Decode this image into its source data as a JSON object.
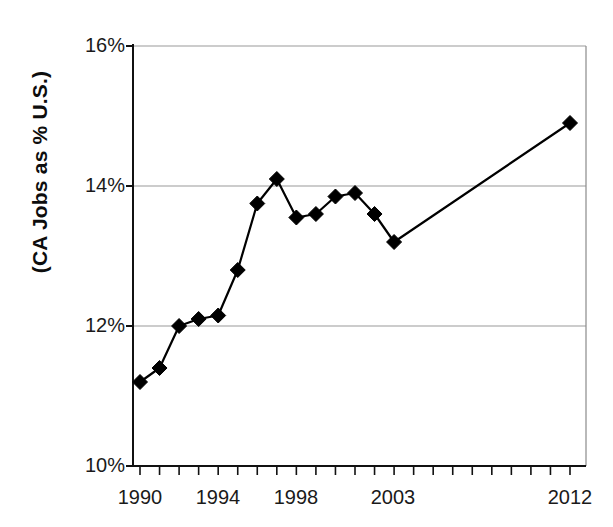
{
  "chart_data": {
    "type": "line",
    "title": "",
    "xlabel": "",
    "ylabel": "(CA Jobs as % U.S.)",
    "xlim": [
      1990,
      2012
    ],
    "ylim": [
      10,
      16
    ],
    "grid": true,
    "legend": "none",
    "marker": "diamond",
    "series_color": "#000000",
    "gridline_color": "#999999",
    "axis_color": "#111111",
    "x": [
      1990,
      1991,
      1992,
      1993,
      1994,
      1995,
      1996,
      1997,
      1998,
      1999,
      2000,
      2001,
      2002,
      2003,
      2012
    ],
    "values": [
      11.2,
      11.4,
      12.0,
      12.1,
      12.15,
      12.8,
      13.75,
      14.1,
      13.55,
      13.6,
      13.85,
      13.9,
      13.6,
      13.2,
      14.9
    ],
    "series": [
      {
        "name": "CA Jobs as % U.S.",
        "values": [
          11.2,
          11.4,
          12.0,
          12.1,
          12.15,
          12.8,
          13.75,
          14.1,
          13.55,
          13.6,
          13.85,
          13.9,
          13.6,
          13.2,
          14.9
        ]
      }
    ],
    "y_ticks": [
      10,
      12,
      14,
      16
    ],
    "y_tick_labels": [
      "10%",
      "12%",
      "14%",
      "16%"
    ],
    "x_tick_values": [
      1990,
      1991,
      1992,
      1993,
      1994,
      1995,
      1996,
      1997,
      1998,
      1999,
      2000,
      2001,
      2002,
      2003,
      2004,
      2005,
      2006,
      2007,
      2008,
      2009,
      2010,
      2011,
      2012
    ],
    "x_tick_labels_shown": [
      {
        "value": 1990,
        "label": "1990"
      },
      {
        "value": 1994,
        "label": "1994"
      },
      {
        "value": 1998,
        "label": "1998"
      },
      {
        "value": 2003,
        "label": "2003"
      },
      {
        "value": 2012,
        "label": "2012"
      }
    ]
  },
  "axis": {
    "y_title": "(CA Jobs as % U.S.)",
    "y_labels": {
      "t16": "16%",
      "t14": "14%",
      "t12": "12%",
      "t10": "10%"
    },
    "x_labels": {
      "x1990": "1990",
      "x1994": "1994",
      "x1998": "1998",
      "x2003": "2003",
      "x2012": "2012"
    }
  }
}
